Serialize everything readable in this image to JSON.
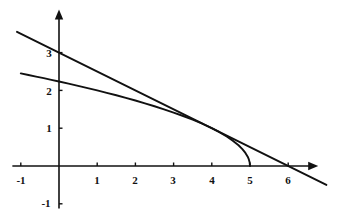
{
  "figure": {
    "title": "",
    "background_color": "#ffffff",
    "ink_color": "#111111",
    "width": 342,
    "height": 220
  },
  "axes": {
    "x_axis_name": "x-axis",
    "y_axis_name": "y-axis",
    "x_arrow": "arrow-right",
    "y_arrow": "arrow-up",
    "origin_px": {
      "x": 59,
      "y": 166
    },
    "unit_px": {
      "x": 38.2,
      "y": 37.8
    },
    "x_range": [
      -1.2,
      7.0
    ],
    "y_range": [
      -1.4,
      4.1
    ],
    "grid": false,
    "legend": false
  },
  "x_ticks": [
    {
      "value": -1,
      "label": "-1",
      "px_x": 21,
      "px_y": 180
    },
    {
      "value": 1,
      "label": "1",
      "px_x": 97,
      "px_y": 180
    },
    {
      "value": 2,
      "label": "2",
      "px_x": 135,
      "px_y": 180
    },
    {
      "value": 3,
      "label": "3",
      "px_x": 173,
      "px_y": 180
    },
    {
      "value": 4,
      "label": "4",
      "px_x": 212,
      "px_y": 180
    },
    {
      "value": 5,
      "label": "5",
      "px_x": 250,
      "px_y": 180
    },
    {
      "value": 6,
      "label": "6",
      "px_x": 288,
      "px_y": 180
    }
  ],
  "y_ticks": [
    {
      "value": 3,
      "label": "3",
      "px_x": 49,
      "px_y": 53
    },
    {
      "value": 2,
      "label": "2",
      "px_x": 49,
      "px_y": 91
    },
    {
      "value": 1,
      "label": "1",
      "px_x": 49,
      "px_y": 128
    },
    {
      "value": -1,
      "label": "-1",
      "px_x": 46,
      "px_y": 203
    }
  ],
  "chart_data": {
    "type": "line",
    "title": "",
    "xlabel": "",
    "ylabel": "",
    "xlim": [
      -1.2,
      7.0
    ],
    "ylim": [
      -1.4,
      4.1
    ],
    "grid": false,
    "legend_position": "none",
    "series": [
      {
        "name": "curve",
        "equation": "y = sqrt(5 - x)",
        "style": "solid",
        "color": "#111111",
        "x": [
          -1.0,
          -0.8,
          -0.6,
          -0.4,
          -0.2,
          0.0,
          0.25,
          0.5,
          0.75,
          1.0,
          1.25,
          1.5,
          1.75,
          2.0,
          2.25,
          2.5,
          2.75,
          3.0,
          3.25,
          3.5,
          3.75,
          4.0,
          4.2,
          4.4,
          4.55,
          4.7,
          4.8,
          4.88,
          4.94,
          4.97,
          4.99,
          5.0
        ],
        "y": [
          2.449,
          2.408,
          2.366,
          2.324,
          2.28,
          2.236,
          2.179,
          2.121,
          2.062,
          2.0,
          1.936,
          1.871,
          1.803,
          1.732,
          1.658,
          1.581,
          1.5,
          1.414,
          1.323,
          1.225,
          1.118,
          1.0,
          0.894,
          0.775,
          0.671,
          0.548,
          0.447,
          0.346,
          0.245,
          0.173,
          0.1,
          0.0
        ]
      },
      {
        "name": "tangent-line",
        "equation": "y = 3 - x/2",
        "style": "solid",
        "color": "#111111",
        "x": [
          -1.1,
          7.0
        ],
        "y": [
          3.55,
          -0.5
        ]
      }
    ],
    "annotations": [
      {
        "name": "x-intercept-of-curve",
        "x": 5,
        "y": 0
      },
      {
        "name": "y-intercept-of-curve",
        "x": 0,
        "y": 2.236
      },
      {
        "name": "tangency-point",
        "x": 4,
        "y": 1
      },
      {
        "name": "line-y-intercept",
        "x": 0,
        "y": 3
      },
      {
        "name": "line-x-intercept",
        "x": 6,
        "y": 0
      }
    ]
  }
}
